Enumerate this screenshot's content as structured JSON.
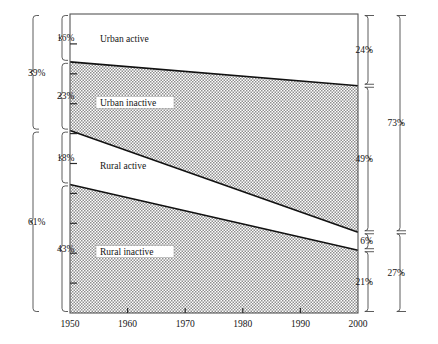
{
  "chart_data": {
    "type": "area",
    "title": "",
    "subtitle": "",
    "xlabel": "",
    "ylabel": "",
    "x": [
      1950,
      2000
    ],
    "xlim": [
      1950,
      2000
    ],
    "ylim": [
      0,
      100
    ],
    "xticks": [
      "1950",
      "1960",
      "1970",
      "1980",
      "1990",
      "2000"
    ],
    "grid": false,
    "legend": "none",
    "stacked": true,
    "stack_order": "top-to-bottom",
    "series": [
      {
        "name": "Urban active",
        "values": [
          16,
          24
        ],
        "fill": "white",
        "label_box": false
      },
      {
        "name": "Urban inactive",
        "values": [
          23,
          49
        ],
        "fill": "shaded",
        "label_box": true
      },
      {
        "name": "Rural active",
        "values": [
          18,
          6
        ],
        "fill": "white",
        "label_box": false
      },
      {
        "name": "Rural inactive",
        "values": [
          43,
          21
        ],
        "fill": "shaded",
        "label_box": true
      }
    ],
    "left_brackets": {
      "segments": [
        {
          "label": "16%",
          "value": 16,
          "series": "Urban active"
        },
        {
          "label": "23%",
          "value": 23,
          "series": "Urban inactive"
        },
        {
          "label": "18%",
          "value": 18,
          "series": "Rural active"
        },
        {
          "label": "43%",
          "value": 43,
          "series": "Rural inactive"
        }
      ],
      "groups": [
        {
          "label": "39%",
          "value": 39,
          "covers": [
            "Urban active",
            "Urban inactive"
          ]
        },
        {
          "label": "61%",
          "value": 61,
          "covers": [
            "Rural active",
            "Rural inactive"
          ]
        }
      ]
    },
    "right_brackets": {
      "segments": [
        {
          "label": "24%",
          "value": 24,
          "series": "Urban active"
        },
        {
          "label": "49%",
          "value": 49,
          "series": "Urban inactive"
        },
        {
          "label": "6%",
          "value": 6,
          "series": "Rural active"
        },
        {
          "label": "21%",
          "value": 21,
          "series": "Rural inactive"
        }
      ],
      "groups": [
        {
          "label": "73%",
          "value": 73,
          "covers": [
            "Urban active",
            "Urban inactive"
          ]
        },
        {
          "label": "27%",
          "value": 27,
          "covers": [
            "Rural active",
            "Rural inactive"
          ]
        }
      ]
    },
    "colors": {
      "shaded_fill": "#c9c9c9",
      "white_fill": "#ffffff",
      "line": "#111111",
      "frame": "#555555",
      "bracket": "#4a4a4a",
      "text": "#141414"
    }
  }
}
